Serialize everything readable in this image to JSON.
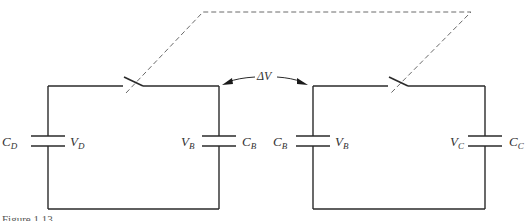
{
  "figure": {
    "type": "circuit-diagram",
    "colors": {
      "wire": "#2a2a2a",
      "mechanical_link": "#6a6a6a",
      "label": "#333333",
      "background": "#ffffff"
    },
    "delta_label": "ΔV",
    "caption_partial": "Figure 1.13"
  },
  "left_circuit": {
    "left_capacitor": {
      "cap_symbol": "C",
      "cap_sub": "D",
      "volt_symbol": "V",
      "volt_sub": "D"
    },
    "right_capacitor": {
      "volt_symbol": "V",
      "volt_sub": "B",
      "cap_symbol": "C",
      "cap_sub": "B"
    },
    "switch": "open"
  },
  "right_circuit": {
    "left_capacitor": {
      "cap_symbol": "C",
      "cap_sub": "B",
      "volt_symbol": "V",
      "volt_sub": "B"
    },
    "right_capacitor": {
      "volt_symbol": "V",
      "volt_sub": "C",
      "cap_symbol": "C",
      "cap_sub": "C"
    },
    "switch": "open"
  }
}
